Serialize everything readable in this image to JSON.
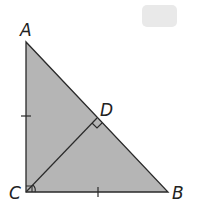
{
  "diagram": {
    "type": "right-triangle-with-altitude",
    "labels": {
      "A": "A",
      "B": "B",
      "C": "C",
      "D": "D"
    },
    "fill_color": "#b5b5b5",
    "stroke_color": "#2a2a2a",
    "badge_color": "#e9e9e9",
    "marks": {
      "right_angle_C": true,
      "right_angle_D": true,
      "congruent_ticks": [
        "AC",
        "CB"
      ],
      "angle_arc_C": true
    }
  }
}
